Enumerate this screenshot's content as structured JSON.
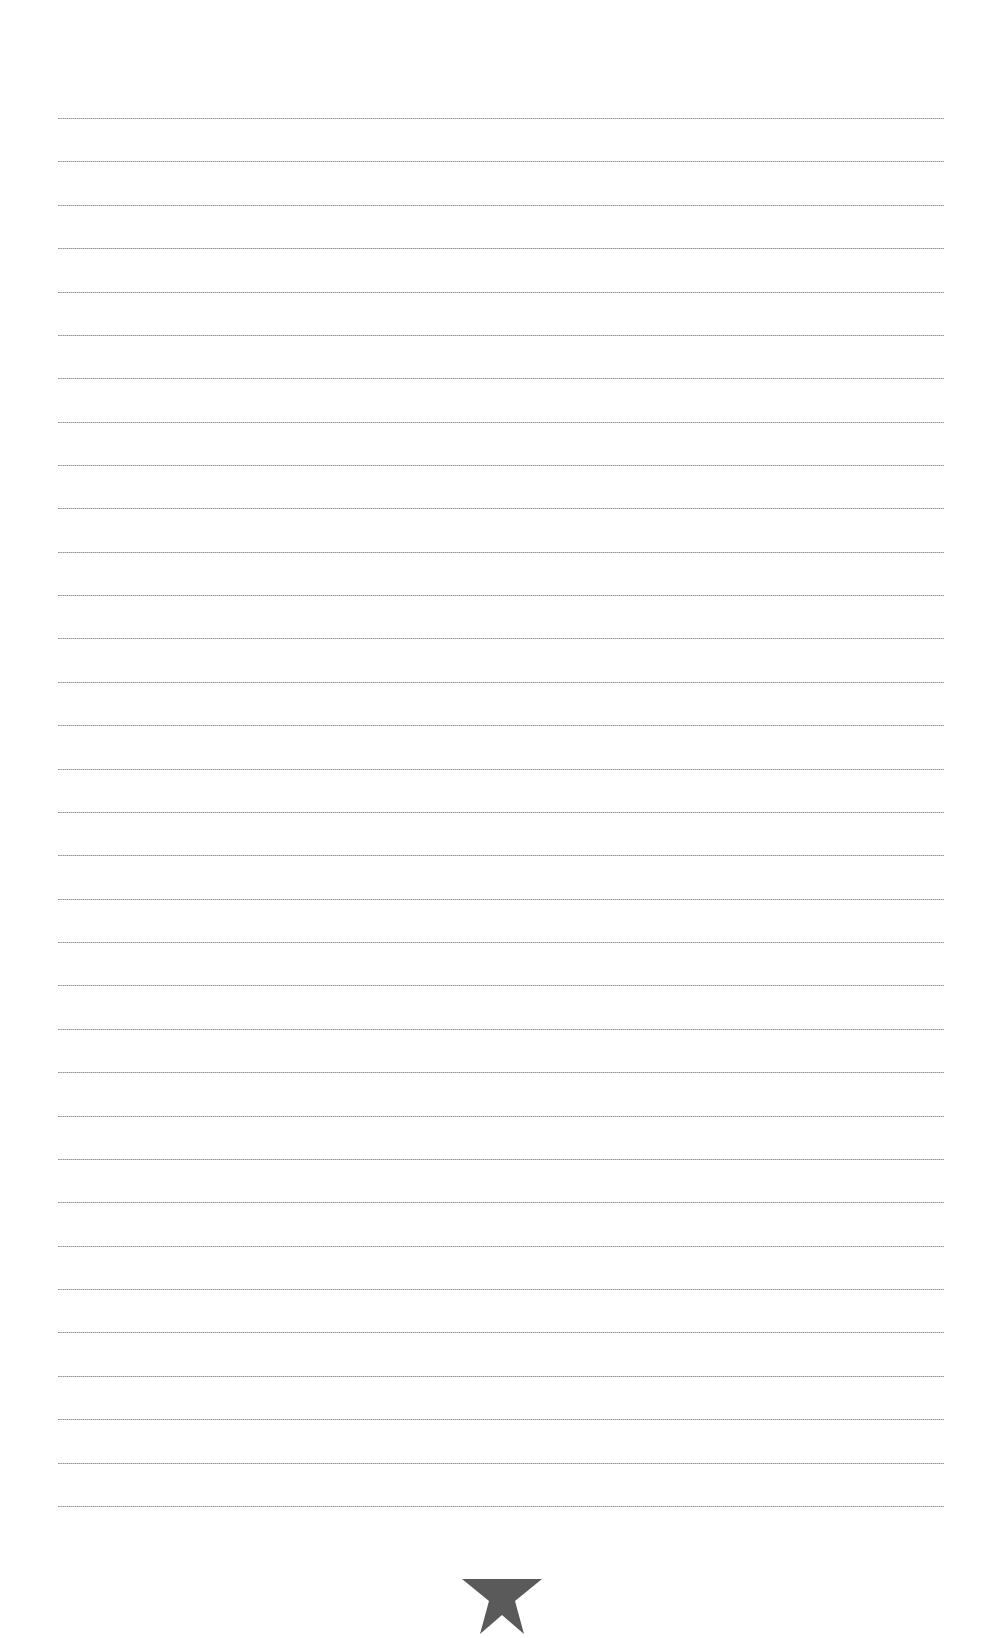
{
  "page": {
    "type": "lined-notepaper",
    "line_count": 33,
    "line_color": "#9a9a9a",
    "footer_icon": "star-icon",
    "footer_icon_color": "#5a5a5a"
  }
}
